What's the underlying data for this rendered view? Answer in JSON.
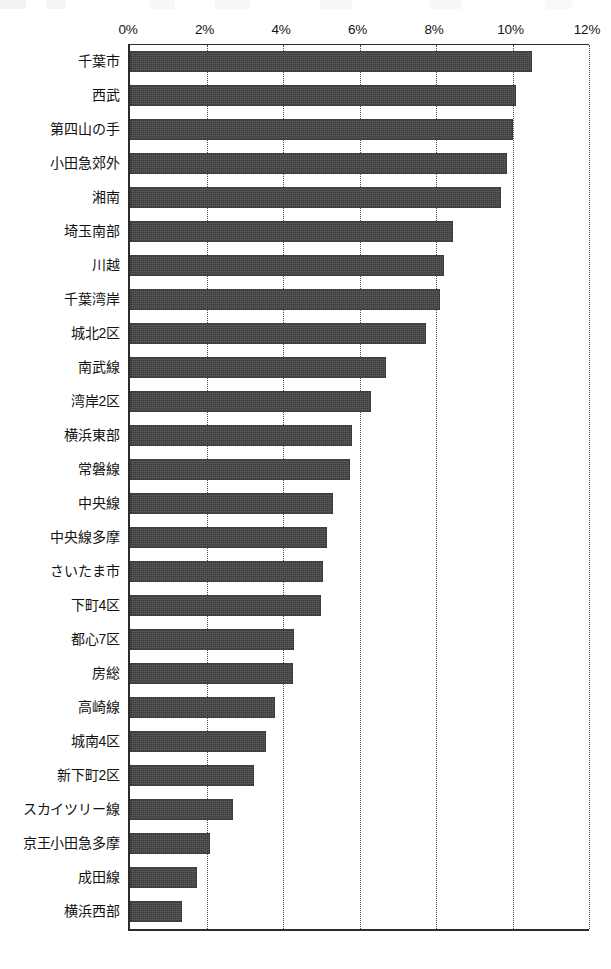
{
  "chart_data": {
    "type": "bar",
    "orientation": "horizontal",
    "title": "",
    "subtitle": "",
    "xlabel": "",
    "ylabel": "",
    "xlim": [
      0,
      12
    ],
    "xunit": "%",
    "xticks": [
      0,
      2,
      4,
      6,
      8,
      10,
      12
    ],
    "xtick_labels": [
      "0%",
      "2%",
      "4%",
      "6%",
      "8%",
      "10%",
      "12%"
    ],
    "grid": "vertical-dotted",
    "legend": "none",
    "bar_color": "#3c3c3c",
    "axis_color": "#2b2b2b",
    "gridline_color": "#4b4b4b",
    "categories": [
      "千葉市",
      "西武",
      "第四山の手",
      "小田急郊外",
      "湘南",
      "埼玉南部",
      "川越",
      "千葉湾岸",
      "城北2区",
      "南武線",
      "湾岸2区",
      "横浜東部",
      "常磐線",
      "中央線",
      "中央線多摩",
      "さいたま市",
      "下町4区",
      "都心7区",
      "房総",
      "高崎線",
      "城南4区",
      "新下町2区",
      "スカイツリー線",
      "京王小田急多摩",
      "成田線",
      "横浜西部"
    ],
    "values": [
      10.5,
      10.1,
      10.0,
      9.85,
      9.7,
      8.45,
      8.2,
      8.1,
      7.75,
      6.7,
      6.3,
      5.8,
      5.75,
      5.3,
      5.15,
      5.05,
      5.0,
      4.3,
      4.25,
      3.8,
      3.55,
      3.25,
      2.7,
      2.1,
      1.75,
      1.35
    ]
  }
}
